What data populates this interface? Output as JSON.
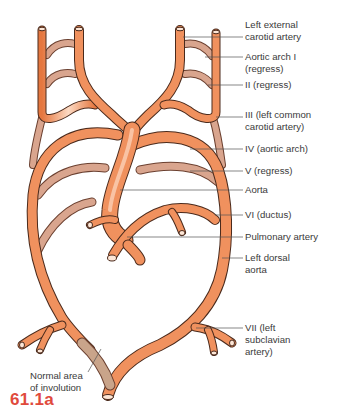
{
  "figure": {
    "id": "61.1a",
    "colors": {
      "vessel": "#f0915e",
      "vessel_highlight": "#fbd7bf",
      "vessel_outline": "#4a2a1c",
      "regressed_vessel": "#d9a58e",
      "involution_area": "#c9a48a",
      "leader_line": "#555555",
      "label_text": "#3a3a3a",
      "figure_number": "#e04a3c"
    }
  },
  "labels": {
    "right": [
      {
        "text": "Left external\ncarotid artery",
        "y": 19,
        "line_y": 37
      },
      {
        "text": "Aortic arch I\n(regress)",
        "y": 51,
        "line_y": 57
      },
      {
        "text": "II (regress)",
        "y": 79,
        "line_y": 85
      },
      {
        "text": "III (left common\ncarotid artery)",
        "y": 109,
        "line_y": 117
      },
      {
        "text": "IV (aortic arch)",
        "y": 145,
        "line_y": 149
      },
      {
        "text": "V (regress)",
        "y": 166,
        "line_y": 171
      },
      {
        "text": "Aorta",
        "y": 184,
        "line_y": 190
      },
      {
        "text": "VI (ductus)",
        "y": 209,
        "line_y": 215
      },
      {
        "text": "Pulmonary artery",
        "y": 232,
        "line_y": 237
      },
      {
        "text": "Left dorsal\naorta",
        "y": 253,
        "line_y": 258
      },
      {
        "text": "VII (left\nsubclavian\nartery)",
        "y": 324,
        "line_y": 328
      }
    ],
    "left": {
      "text": "Normal area\nof involution"
    }
  }
}
